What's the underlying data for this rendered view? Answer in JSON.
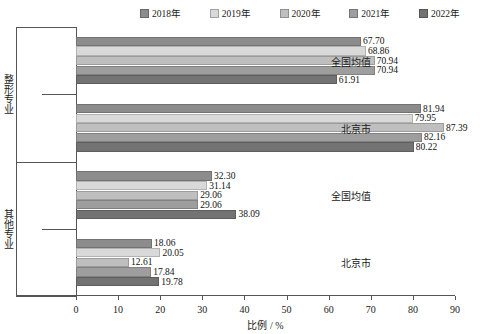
{
  "chart_data": {
    "type": "bar",
    "orientation": "horizontal",
    "title": "",
    "xlabel": "比例 / %",
    "ylabel": "",
    "xlim": [
      0,
      90
    ],
    "xticks": [
      0,
      10,
      20,
      30,
      40,
      50,
      60,
      70,
      80,
      90
    ],
    "grid": false,
    "legend_position": "top",
    "legend": [
      "2018年",
      "2019年",
      "2020年",
      "2021年",
      "2022年"
    ],
    "series": [
      {
        "name": "2018年",
        "color": "#8c8c8c",
        "values": [
          67.7,
          81.94,
          32.3,
          18.06
        ]
      },
      {
        "name": "2019年",
        "color": "#d9d9d9",
        "values": [
          68.86,
          79.95,
          31.14,
          20.05
        ]
      },
      {
        "name": "2020年",
        "color": "#bfbfbf",
        "values": [
          70.94,
          87.39,
          29.06,
          12.61
        ]
      },
      {
        "name": "2021年",
        "color": "#9e9e9e",
        "values": [
          70.94,
          82.16,
          29.06,
          17.84
        ]
      },
      {
        "name": "2022年",
        "color": "#737373",
        "values": [
          61.91,
          80.22,
          38.09,
          19.78
        ]
      }
    ],
    "groups": [
      {
        "outer": "整形专业",
        "inner": "全国均值"
      },
      {
        "outer": "整形专业",
        "inner": "北京市"
      },
      {
        "outer": "其他专业",
        "inner": "全国均值"
      },
      {
        "outer": "其他专业",
        "inner": "北京市"
      }
    ],
    "outer_categories": [
      "整形专业",
      "其他专业"
    ],
    "inner_categories": [
      "全国均值",
      "北京市"
    ],
    "value_labels": [
      [
        "67.70",
        "68.86",
        "70.94",
        "70.94",
        "61.91"
      ],
      [
        "81.94",
        "79.95",
        "87.39",
        "82.16",
        "80.22"
      ],
      [
        "32.30",
        "31.14",
        "29.06",
        "29.06",
        "38.09"
      ],
      [
        "18.06",
        "20.05",
        "12.61",
        "17.84",
        "19.78"
      ]
    ]
  }
}
